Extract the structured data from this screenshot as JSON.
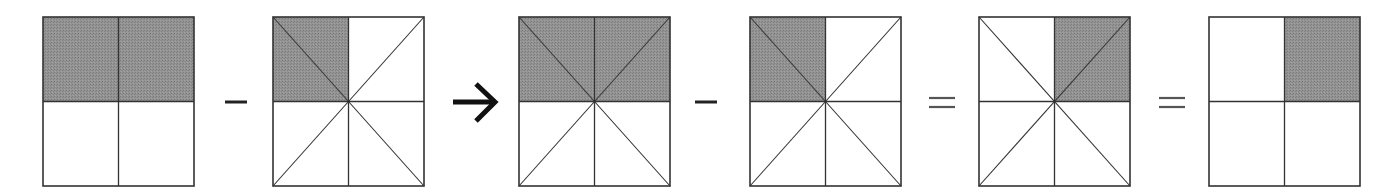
{
  "diagram": {
    "colors": {
      "fill": "#8c8c8c",
      "stroke": "#333333",
      "background": "#ffffff"
    },
    "squares": [
      {
        "id": "square-1",
        "x": 43,
        "partition": "quarters",
        "shaded": [
          "top-left",
          "top-right"
        ],
        "fraction": "2/4"
      },
      {
        "id": "square-2",
        "x": 273,
        "partition": "eighths",
        "shaded": [
          "top-left-lower",
          "top-left-upper"
        ],
        "fraction": "2/8"
      },
      {
        "id": "square-3",
        "x": 519,
        "partition": "eighths",
        "shaded": [
          "top-left-lower",
          "top-left-upper",
          "top-right-upper",
          "top-right-lower"
        ],
        "fraction": "4/8"
      },
      {
        "id": "square-4",
        "x": 750,
        "partition": "eighths",
        "shaded": [
          "top-left-lower",
          "top-left-upper"
        ],
        "fraction": "2/8"
      },
      {
        "id": "square-5",
        "x": 979,
        "partition": "eighths",
        "shaded": [
          "top-right-upper",
          "top-right-lower"
        ],
        "fraction": "2/8"
      },
      {
        "id": "square-6",
        "x": 1209,
        "partition": "quarters",
        "shaded": [
          "top-right"
        ],
        "fraction": "1/4"
      }
    ],
    "operators": [
      {
        "id": "minus-1",
        "symbol": "minus",
        "x": 236
      },
      {
        "id": "arrow-1",
        "symbol": "arrow-right",
        "x": 474
      },
      {
        "id": "minus-2",
        "symbol": "minus",
        "x": 706
      },
      {
        "id": "equals-1",
        "symbol": "equals",
        "x": 942
      },
      {
        "id": "equals-2",
        "symbol": "equals",
        "x": 1172
      }
    ]
  }
}
